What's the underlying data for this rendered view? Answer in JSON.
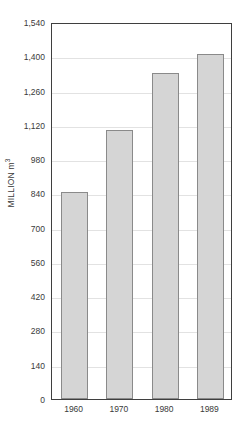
{
  "chart_data": {
    "type": "bar",
    "title": "",
    "subtitle": "",
    "xlabel": "",
    "ylabel": "MILLION m3",
    "ylabel_prefix": "MILLION m",
    "ylabel_superscript": "3",
    "categories": [
      "1960",
      "1970",
      "1980",
      "1989"
    ],
    "values": [
      845,
      1100,
      1330,
      1410
    ],
    "series": [
      {
        "name": "Volume",
        "values": [
          845,
          1100,
          1330,
          1410
        ]
      }
    ],
    "ylim": [
      0,
      1540
    ],
    "xlim_categories": 4,
    "y_tick_values": [
      0,
      140,
      280,
      420,
      560,
      700,
      840,
      980,
      1120,
      1260,
      1400,
      1540
    ],
    "y_tick_labels": [
      "0",
      "140",
      "280",
      "420",
      "560",
      "700",
      "840",
      "980",
      "1,120",
      "1,260",
      "1,400",
      "1,540"
    ],
    "y_tick_interval": 140,
    "grid": true,
    "grid_axis": "y",
    "legend": false,
    "legend_position": "none",
    "bar_fill_color": "#d5d5d5",
    "bar_border_color": "#8a8a8a",
    "grid_color": "#e2e2e2",
    "axis_color": "#3f3f3f",
    "text_color": "#3a3a3a",
    "background_color": "#ffffff",
    "annotations": []
  }
}
